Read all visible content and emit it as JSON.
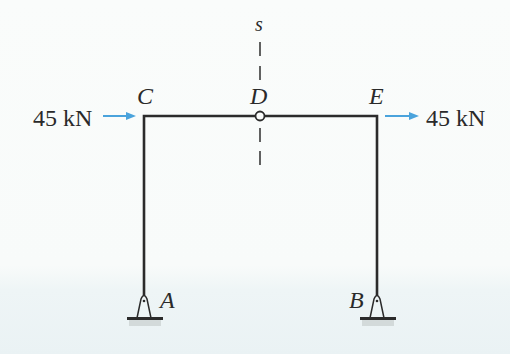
{
  "diagram": {
    "type": "three-hinged frame",
    "section_label": "s",
    "nodes": {
      "A": {
        "label": "A",
        "kind": "pin-support"
      },
      "B": {
        "label": "B",
        "kind": "pin-support"
      },
      "C": {
        "label": "C",
        "kind": "rigid-corner"
      },
      "D": {
        "label": "D",
        "kind": "internal-hinge"
      },
      "E": {
        "label": "E",
        "kind": "rigid-corner"
      }
    },
    "loads": [
      {
        "id": "left",
        "label": "45 kN",
        "at": "C",
        "direction": "right"
      },
      {
        "id": "right",
        "label": "45 kN",
        "at": "E",
        "direction": "right"
      }
    ],
    "colors": {
      "member": "#2b2b2b",
      "arrow": "#4aa3dc",
      "text": "#2a2a2a"
    }
  }
}
